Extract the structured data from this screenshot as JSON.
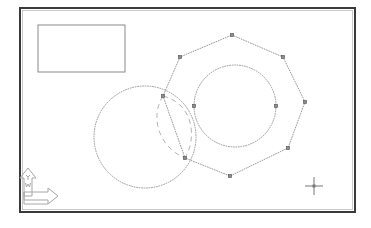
{
  "app": {
    "title": "CAD Drawing Canvas",
    "background_color": "#ffffff"
  },
  "viewport": {
    "name": "drawing-viewport",
    "frame": {
      "x": 20,
      "y": 8,
      "width": 335,
      "height": 204
    },
    "border_color": "#3a3a3a",
    "border_width": 2,
    "inner_border_color": "#8f8f8f",
    "inner_border_width": 1
  },
  "entities": [
    {
      "id": "rectangle-1",
      "type": "rectangle",
      "label": "Rectangle",
      "x": 38,
      "y": 25,
      "width": 87,
      "height": 47,
      "stroke": "#8a8a8a",
      "stroke_width": 1,
      "linetype": "continuous",
      "selected": false
    },
    {
      "id": "circle-left",
      "type": "circle",
      "label": "Circle (left)",
      "cx": 145,
      "cy": 137,
      "r": 51,
      "stroke": "#9a9a9a",
      "stroke_width": 1,
      "linetype": "dotted",
      "selected": false
    },
    {
      "id": "polygon-octagon",
      "type": "polygon",
      "label": "Polygon (8 sides)",
      "stroke": "#9a9a9a",
      "stroke_width": 1,
      "linetype": "dotted",
      "selected": true,
      "vertices": [
        {
          "x": 232,
          "y": 35
        },
        {
          "x": 283,
          "y": 57
        },
        {
          "x": 305,
          "y": 102
        },
        {
          "x": 288,
          "y": 148
        },
        {
          "x": 230,
          "y": 176
        },
        {
          "x": 185,
          "y": 158
        },
        {
          "x": 163,
          "y": 96
        },
        {
          "x": 180,
          "y": 57
        }
      ]
    },
    {
      "id": "circle-inner",
      "type": "circle",
      "label": "Circle (inner)",
      "cx": 235,
      "cy": 106,
      "r": 41,
      "stroke": "#9a9a9a",
      "stroke_width": 1,
      "linetype": "dotted",
      "selected": true,
      "grips": [
        {
          "x": 194,
          "y": 106
        },
        {
          "x": 276,
          "y": 106
        }
      ]
    },
    {
      "id": "arc-preview-lens",
      "type": "arc-pair",
      "label": "Arc preview (rubber band)",
      "stroke": "#b0b0b0",
      "stroke_width": 1,
      "linetype": "dashed",
      "selected": false,
      "start": {
        "x": 163,
        "y": 96
      },
      "end": {
        "x": 185,
        "y": 158
      }
    }
  ],
  "grips": {
    "name": "selection-grips",
    "size": 3.4,
    "fill": "#8c8c8c",
    "stroke": "#4a4a4a"
  },
  "ucs_icon": {
    "name": "ucs-icon",
    "label": "UCS Icon",
    "x_axis_label": "X",
    "y_axis_label": "Y",
    "world_label": "W",
    "stroke": "#a6a6a6",
    "stroke_width": 1
  },
  "crosshair": {
    "name": "crosshair-cursor",
    "label": "Crosshair Cursor",
    "x": 314,
    "y": 186,
    "arm": 9,
    "stroke": "#777777",
    "center_size": 3
  }
}
